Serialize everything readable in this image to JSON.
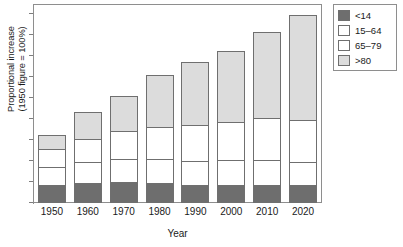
{
  "chart_data": {
    "type": "bar",
    "subtype": "stacked-vertical",
    "title": "",
    "xlabel": "Year",
    "ylabel": "Proportional increase (1950 figure = 100%)",
    "ylabel_line1": "Proportional increase",
    "ylabel_line2": "(1950 figure = 100%)",
    "categories": [
      "1950",
      "1960",
      "1970",
      "1980",
      "1990",
      "2000",
      "2010",
      "2020"
    ],
    "series": [
      {
        "name": "<14",
        "color": "#6e6e6e",
        "values": [
          26,
          30,
          31,
          30,
          26,
          26,
          26,
          26
        ]
      },
      {
        "name": "15-64",
        "color": "#ffffff",
        "values": [
          27,
          30,
          33,
          34,
          36,
          37,
          37,
          34
        ]
      },
      {
        "name": "65-79",
        "color": "#ffffff",
        "values": [
          26,
          34,
          42,
          48,
          52,
          56,
          62,
          62
        ]
      },
      {
        "name": ">80",
        "color": "#dcdcdc",
        "values": [
          21,
          40,
          51,
          75,
          93,
          103,
          126,
          153
        ]
      }
    ],
    "totals": [
      100,
      134,
      157,
      187,
      207,
      222,
      251,
      275
    ],
    "yaxis": {
      "ticks_visible": true,
      "tick_count": 10,
      "labels_shown": false,
      "range_note": "unlabeled ticks"
    },
    "grid": false,
    "legend": {
      "position": "top-right",
      "bordered": true
    }
  },
  "legend_items": [
    {
      "label": "<14"
    },
    {
      "label": "15–64"
    },
    {
      "label": "65–79"
    },
    {
      "label": ">80"
    }
  ]
}
